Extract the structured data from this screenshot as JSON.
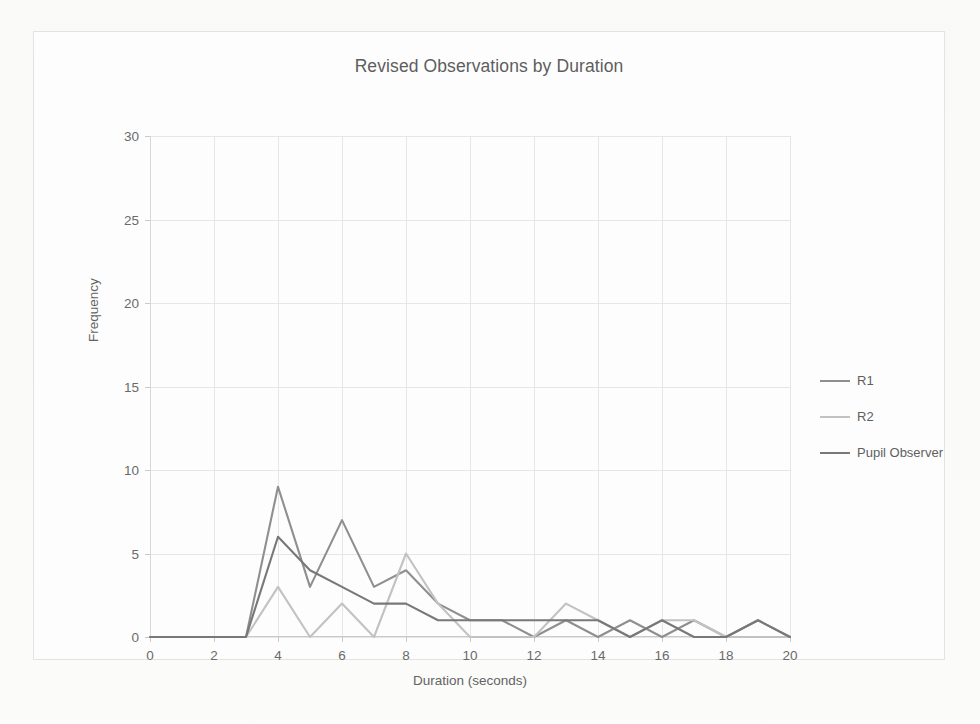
{
  "chart_data": {
    "type": "line",
    "title": "Revised Observations by Duration",
    "xlabel": "Duration (seconds)",
    "ylabel": "Frequency",
    "xlim": [
      0,
      20
    ],
    "ylim": [
      0,
      30
    ],
    "xticks": [
      0,
      2,
      4,
      6,
      8,
      10,
      12,
      14,
      16,
      18,
      20
    ],
    "yticks": [
      0,
      5,
      10,
      15,
      20,
      25,
      30
    ],
    "grid": true,
    "legend_position": "right",
    "x": [
      0,
      1,
      2,
      3,
      4,
      5,
      6,
      7,
      8,
      9,
      10,
      11,
      12,
      13,
      14,
      15,
      16,
      17,
      18,
      19,
      20
    ],
    "series": [
      {
        "name": "R1",
        "color": "#8f8f8f",
        "values": [
          0,
          0,
          0,
          0,
          9,
          3,
          7,
          3,
          4,
          2,
          1,
          1,
          0,
          1,
          0,
          1,
          0,
          1,
          0,
          1,
          0
        ]
      },
      {
        "name": "R2",
        "color": "#c2c2c2",
        "values": [
          0,
          0,
          0,
          0,
          3,
          0,
          2,
          0,
          5,
          2,
          0,
          0,
          0,
          2,
          1,
          0,
          1,
          1,
          0,
          0,
          0
        ]
      },
      {
        "name": "Pupil Observer",
        "color": "#787878",
        "values": [
          0,
          0,
          0,
          0,
          6,
          4,
          3,
          2,
          2,
          1,
          1,
          1,
          1,
          1,
          1,
          0,
          1,
          0,
          0,
          1,
          0
        ]
      }
    ]
  },
  "legend": {
    "items": [
      {
        "label": "R1",
        "color": "#8f8f8f"
      },
      {
        "label": "R2",
        "color": "#c2c2c2"
      },
      {
        "label": "Pupil Observer",
        "color": "#787878"
      }
    ]
  }
}
